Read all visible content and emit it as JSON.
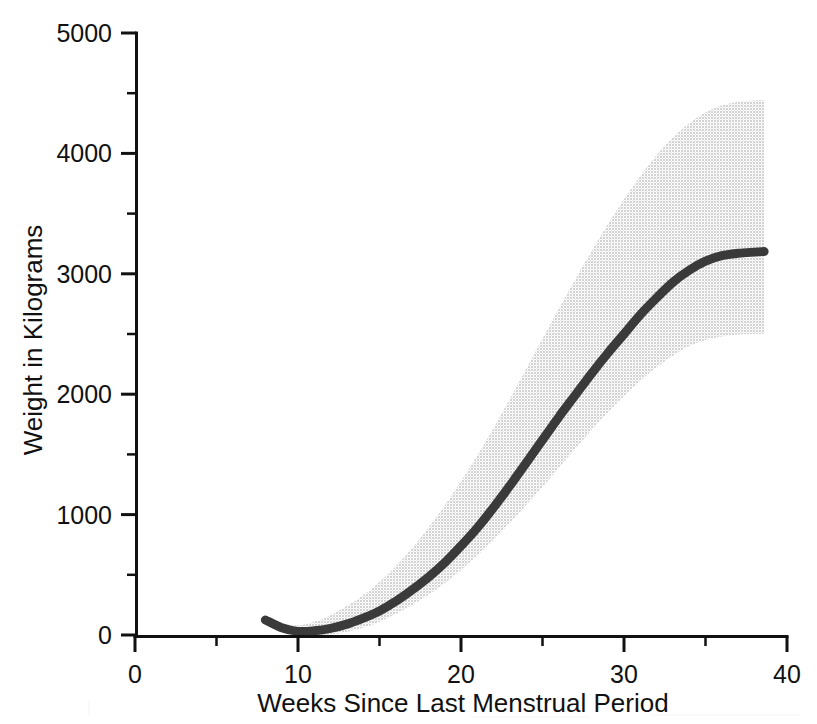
{
  "chart_data": {
    "type": "line",
    "title": "",
    "subtitle": "",
    "xlabel": "Weeks Since Last Menstrual Period",
    "ylabel": "Weight in Kilograms",
    "xlim": [
      0,
      40
    ],
    "ylim": [
      0,
      5000
    ],
    "grid": false,
    "legend": null,
    "x_major_ticks": [
      0,
      10,
      20,
      30,
      40
    ],
    "x_minor_ticks": [
      5,
      15,
      25,
      35
    ],
    "y_major_ticks": [
      0,
      1000,
      2000,
      3000,
      4000,
      5000
    ],
    "y_minor_ticks": [
      500,
      1500,
      2500,
      3500,
      4500
    ],
    "x_tick_labels": [
      "0",
      "10",
      "20",
      "30",
      "40"
    ],
    "y_tick_labels": [
      "0",
      "1000",
      "2000",
      "3000",
      "4000",
      "5000"
    ],
    "annotations": [],
    "series": [
      {
        "name": "Mean estimated fetal weight",
        "style": "solid-line",
        "color": "#3a3a3a",
        "x": [
          8,
          9,
          10,
          11,
          12,
          13,
          14,
          15,
          16,
          17,
          18,
          19,
          20,
          21,
          22,
          23,
          24,
          25,
          26,
          27,
          28,
          29,
          30,
          31,
          32,
          33,
          34,
          35,
          36,
          37,
          38,
          38.6
        ],
        "values": [
          125,
          60,
          30,
          35,
          55,
          90,
          140,
          200,
          280,
          375,
          480,
          600,
          740,
          890,
          1060,
          1240,
          1430,
          1620,
          1810,
          1990,
          2170,
          2340,
          2500,
          2660,
          2800,
          2930,
          3030,
          3105,
          3150,
          3170,
          3180,
          3185
        ]
      },
      {
        "name": "Upper bound",
        "style": "band-edge",
        "color": "#d8d8d8",
        "x": [
          8,
          9,
          10,
          11,
          12,
          13,
          14,
          15,
          16,
          17,
          18,
          19,
          20,
          21,
          22,
          23,
          24,
          25,
          26,
          27,
          28,
          29,
          30,
          31,
          32,
          33,
          34,
          35,
          36,
          37,
          38,
          38.6
        ],
        "values": [
          160,
          100,
          80,
          110,
          165,
          240,
          330,
          440,
          570,
          720,
          890,
          1075,
          1275,
          1490,
          1720,
          1960,
          2210,
          2460,
          2710,
          2950,
          3185,
          3410,
          3620,
          3810,
          3985,
          4130,
          4250,
          4340,
          4400,
          4430,
          4440,
          4440
        ]
      },
      {
        "name": "Lower bound",
        "style": "band-edge",
        "color": "#d8d8d8",
        "x": [
          8,
          9,
          10,
          11,
          12,
          13,
          14,
          15,
          16,
          17,
          18,
          19,
          20,
          21,
          22,
          23,
          24,
          25,
          26,
          27,
          28,
          29,
          30,
          31,
          32,
          33,
          34,
          35,
          36,
          37,
          38,
          38.6
        ],
        "values": [
          90,
          25,
          0,
          0,
          5,
          25,
          60,
          110,
          175,
          250,
          335,
          430,
          540,
          660,
          790,
          930,
          1080,
          1230,
          1390,
          1545,
          1700,
          1845,
          1985,
          2110,
          2225,
          2320,
          2400,
          2450,
          2480,
          2495,
          2500,
          2500
        ]
      }
    ],
    "colors": {
      "curve": "#3a3a3a",
      "band": "#d8d8d8",
      "axis": "#111111",
      "background": "#ffffff"
    }
  },
  "axes": {
    "y_title": "Weight in Kilograms",
    "x_title": "Weeks Since Last Menstrual Period"
  },
  "labels": {
    "y": [
      "5000",
      "4000",
      "3000",
      "2000",
      "1000",
      "0"
    ],
    "x": [
      "0",
      "10",
      "20",
      "30",
      "40"
    ]
  }
}
